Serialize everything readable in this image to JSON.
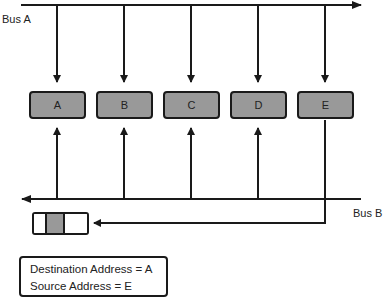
{
  "diagram": {
    "type": "bus-topology-frame-transmission",
    "buses": [
      {
        "id": "bus_a",
        "label": "Bus A",
        "direction": "left-to-right"
      },
      {
        "id": "bus_b",
        "label": "Bus B",
        "direction": "right-to-left"
      }
    ],
    "nodes": [
      {
        "id": "A",
        "label": "A"
      },
      {
        "id": "B",
        "label": "B"
      },
      {
        "id": "C",
        "label": "C"
      },
      {
        "id": "D",
        "label": "D"
      },
      {
        "id": "E",
        "label": "E"
      }
    ],
    "edges": [
      {
        "from": "bus_a",
        "to": "A",
        "arrow": "down"
      },
      {
        "from": "bus_a",
        "to": "B",
        "arrow": "down"
      },
      {
        "from": "bus_a",
        "to": "C",
        "arrow": "down"
      },
      {
        "from": "bus_a",
        "to": "D",
        "arrow": "down"
      },
      {
        "from": "bus_a",
        "to": "E",
        "arrow": "down"
      },
      {
        "from": "bus_b",
        "to": "A",
        "arrow": "up"
      },
      {
        "from": "bus_b",
        "to": "B",
        "arrow": "up"
      },
      {
        "from": "bus_b",
        "to": "C",
        "arrow": "up"
      },
      {
        "from": "bus_b",
        "to": "D",
        "arrow": "up"
      },
      {
        "from": "E",
        "to": "frame",
        "arrow": "left",
        "note": "E transmits frame onto Bus B"
      }
    ],
    "frame": {
      "segments": [
        "empty",
        "filled",
        "empty"
      ]
    },
    "info_box": {
      "line1": "Destination Address = A",
      "line2": "Source Address = E"
    },
    "colors": {
      "node_fill": "#999999",
      "stroke": "#1a1a1a",
      "background": "#ffffff"
    }
  }
}
